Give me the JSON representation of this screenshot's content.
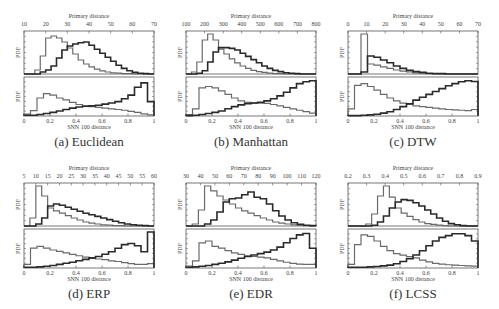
{
  "figure": {
    "panels": [
      {
        "id": "a",
        "caption": "(a) Euclidean",
        "top_axis_label": "Primary distance",
        "bottom_axis_label": "SNN 100 distance",
        "ylabel": "PDF",
        "top_ticks": [
          "10",
          "20",
          "30",
          "40",
          "50",
          "60",
          "70"
        ],
        "bottom_ticks": [
          "0",
          "0.2",
          "0.4",
          "0.6",
          "0.8",
          "1"
        ]
      },
      {
        "id": "b",
        "caption": "(b) Manhattan",
        "top_axis_label": "Primary distance",
        "bottom_axis_label": "SNN 100 distance",
        "ylabel": "PDF",
        "top_ticks": [
          "100",
          "200",
          "300",
          "400",
          "500",
          "600",
          "700",
          "800"
        ],
        "bottom_ticks": [
          "0",
          "0.2",
          "0.4",
          "0.6",
          "0.8",
          "1"
        ]
      },
      {
        "id": "c",
        "caption": "(c) DTW",
        "top_axis_label": "Primary distance",
        "bottom_axis_label": "SNN 100 distance",
        "ylabel": "PDF",
        "top_ticks": [
          "0",
          "10",
          "20",
          "30",
          "40",
          "50",
          "60",
          "70"
        ],
        "bottom_ticks": [
          "0",
          "0.2",
          "0.4",
          "0.6",
          "0.8",
          "1"
        ]
      },
      {
        "id": "d",
        "caption": "(d) ERP",
        "top_axis_label": "Primary distance",
        "bottom_axis_label": "SNN 100 distance",
        "ylabel": "PDF",
        "top_ticks": [
          "5",
          "10",
          "15",
          "20",
          "25",
          "30",
          "35",
          "40",
          "45",
          "50",
          "55",
          "60"
        ],
        "bottom_ticks": [
          "0",
          "0.2",
          "0.4",
          "0.6",
          "0.8",
          "1"
        ]
      },
      {
        "id": "e",
        "caption": "(e) EDR",
        "top_axis_label": "Primary distance",
        "bottom_axis_label": "SNN 100 distance",
        "ylabel": "PDF",
        "top_ticks": [
          "30",
          "40",
          "50",
          "60",
          "70",
          "80",
          "90",
          "100",
          "110",
          "120"
        ],
        "bottom_ticks": [
          "0",
          "0.2",
          "0.4",
          "0.6",
          "0.8",
          "1"
        ]
      },
      {
        "id": "f",
        "caption": "(f) LCSS",
        "top_axis_label": "Primary distance",
        "bottom_axis_label": "SNN 100 distance",
        "ylabel": "PDF",
        "top_ticks": [
          "0.2",
          "0.3",
          "0.4",
          "0.5",
          "0.6",
          "0.7",
          "0.8",
          "0.9"
        ],
        "bottom_ticks": [
          "0",
          "0.2",
          "0.4",
          "0.6",
          "0.8",
          "1"
        ]
      }
    ],
    "colors": {
      "dark_series": "#2a2a2a",
      "light_series": "#6a6a6a",
      "frame": "#555555"
    }
  },
  "chart_data": [
    {
      "type": "bar",
      "title": "(a) Euclidean",
      "xlabel_top": "Primary distance",
      "xlabel_bottom": "SNN 100 distance",
      "ylabel": "PDF",
      "top": {
        "xlim": [
          10,
          70
        ],
        "series": [
          {
            "name": "light",
            "values": [
              0,
              0,
              0.1,
              0.45,
              0.9,
              0.95,
              0.9,
              0.8,
              0.65,
              0.5,
              0.35,
              0.25,
              0.18,
              0.12,
              0.08,
              0.05,
              0.03,
              0.02,
              0.01,
              0.01,
              0,
              0,
              0,
              0
            ]
          },
          {
            "name": "dark",
            "values": [
              0,
              0,
              0,
              0.05,
              0.1,
              0.2,
              0.4,
              0.6,
              0.7,
              0.75,
              0.78,
              0.8,
              0.72,
              0.62,
              0.52,
              0.42,
              0.32,
              0.22,
              0.14,
              0.08,
              0.04,
              0.02,
              0.01,
              0
            ]
          }
        ]
      },
      "bottom": {
        "xlim": [
          0,
          1
        ],
        "series": [
          {
            "name": "light",
            "values": [
              0.05,
              0.15,
              0.5,
              0.62,
              0.58,
              0.5,
              0.45,
              0.38,
              0.32,
              0.28,
              0.26,
              0.24,
              0.22,
              0.2,
              0.18,
              0.16,
              0.13,
              0.1,
              0.06,
              0.03
            ]
          },
          {
            "name": "dark",
            "values": [
              0.02,
              0.02,
              0.04,
              0.07,
              0.1,
              0.14,
              0.18,
              0.22,
              0.25,
              0.27,
              0.28,
              0.3,
              0.33,
              0.36,
              0.4,
              0.48,
              0.58,
              0.8,
              0.92,
              0.4
            ]
          }
        ]
      }
    },
    {
      "type": "bar",
      "title": "(b) Manhattan",
      "xlabel_top": "Primary distance",
      "xlabel_bottom": "SNN 100 distance",
      "ylabel": "PDF",
      "top": {
        "xlim": [
          100,
          800
        ],
        "series": [
          {
            "name": "light",
            "values": [
              0,
              0.05,
              0.3,
              0.85,
              1.0,
              0.85,
              0.62,
              0.5,
              0.38,
              0.28,
              0.2,
              0.14,
              0.09,
              0.06,
              0.04,
              0.02,
              0.01,
              0.01,
              0,
              0,
              0,
              0,
              0,
              0
            ]
          },
          {
            "name": "dark",
            "values": [
              0,
              0,
              0.02,
              0.08,
              0.3,
              0.55,
              0.66,
              0.66,
              0.64,
              0.6,
              0.52,
              0.44,
              0.36,
              0.28,
              0.2,
              0.14,
              0.09,
              0.06,
              0.03,
              0.02,
              0.01,
              0,
              0,
              0
            ]
          }
        ]
      },
      "bottom": {
        "xlim": [
          0,
          1
        ],
        "series": [
          {
            "name": "light",
            "values": [
              0.04,
              0.2,
              0.78,
              0.82,
              0.78,
              0.7,
              0.6,
              0.5,
              0.42,
              0.38,
              0.36,
              0.36,
              0.35,
              0.32,
              0.28,
              0.24,
              0.2,
              0.16,
              0.12,
              0.08
            ]
          },
          {
            "name": "dark",
            "values": [
              0.01,
              0.02,
              0.04,
              0.07,
              0.1,
              0.14,
              0.2,
              0.26,
              0.31,
              0.34,
              0.36,
              0.38,
              0.42,
              0.48,
              0.56,
              0.66,
              0.78,
              0.9,
              0.95,
              0.98
            ]
          }
        ]
      }
    },
    {
      "type": "bar",
      "title": "(c) DTW",
      "xlabel_top": "Primary distance",
      "xlabel_bottom": "SNN 100 distance",
      "ylabel": "PDF",
      "top": {
        "xlim": [
          0,
          70
        ],
        "series": [
          {
            "name": "light",
            "values": [
              0,
              0,
              1.0,
              0.25,
              0.22,
              0.18,
              0.14,
              0.1,
              0.07,
              0.05,
              0.03,
              0.02,
              0.01,
              0.01,
              0,
              0,
              0,
              0,
              0,
              0
            ]
          },
          {
            "name": "dark",
            "values": [
              0,
              0,
              0.05,
              0.45,
              0.42,
              0.35,
              0.28,
              0.2,
              0.14,
              0.09,
              0.06,
              0.04,
              0.02,
              0.01,
              0.01,
              0,
              0,
              0,
              0,
              0
            ]
          }
        ]
      },
      "bottom": {
        "xlim": [
          0,
          1
        ],
        "series": [
          {
            "name": "light",
            "values": [
              0.2,
              0.85,
              0.9,
              0.82,
              0.72,
              0.6,
              0.5,
              0.42,
              0.36,
              0.32,
              0.28,
              0.26,
              0.24,
              0.22,
              0.2,
              0.18,
              0.17,
              0.16,
              0.15,
              0.18
            ]
          },
          {
            "name": "dark",
            "values": [
              0.01,
              0.01,
              0.02,
              0.03,
              0.05,
              0.08,
              0.12,
              0.18,
              0.26,
              0.34,
              0.44,
              0.52,
              0.6,
              0.68,
              0.76,
              0.84,
              0.9,
              0.95,
              0.98,
              0.96
            ]
          }
        ]
      }
    },
    {
      "type": "bar",
      "title": "(d) ERP",
      "xlabel_top": "Primary distance",
      "xlabel_bottom": "SNN 100 distance",
      "ylabel": "PDF",
      "top": {
        "xlim": [
          5,
          60
        ],
        "series": [
          {
            "name": "light",
            "values": [
              0,
              0.2,
              1.0,
              0.75,
              0.45,
              0.38,
              0.32,
              0.26,
              0.2,
              0.15,
              0.1,
              0.07,
              0.05,
              0.03,
              0.02,
              0.01,
              0.01,
              0,
              0,
              0,
              0,
              0
            ]
          },
          {
            "name": "dark",
            "values": [
              0,
              0,
              0.05,
              0.2,
              0.5,
              0.55,
              0.52,
              0.47,
              0.42,
              0.37,
              0.32,
              0.28,
              0.24,
              0.2,
              0.16,
              0.12,
              0.08,
              0.05,
              0.03,
              0.02,
              0.01,
              0
            ]
          }
        ]
      },
      "bottom": {
        "xlim": [
          0,
          1
        ],
        "series": [
          {
            "name": "light",
            "values": [
              0.1,
              0.55,
              0.6,
              0.55,
              0.5,
              0.46,
              0.42,
              0.38,
              0.34,
              0.3,
              0.27,
              0.25,
              0.23,
              0.2,
              0.18,
              0.15,
              0.12,
              0.1,
              0.1,
              0.12
            ]
          },
          {
            "name": "dark",
            "values": [
              0.02,
              0.02,
              0.03,
              0.05,
              0.07,
              0.1,
              0.13,
              0.16,
              0.2,
              0.24,
              0.28,
              0.32,
              0.38,
              0.45,
              0.55,
              0.65,
              0.68,
              0.62,
              0.45,
              1.0
            ]
          }
        ]
      }
    },
    {
      "type": "bar",
      "title": "(e) EDR",
      "xlabel_top": "Primary distance",
      "xlabel_bottom": "SNN 100 distance",
      "ylabel": "PDF",
      "top": {
        "xlim": [
          30,
          120
        ],
        "series": [
          {
            "name": "light",
            "values": [
              0,
              0.05,
              0.4,
              1.0,
              0.88,
              0.75,
              0.65,
              0.55,
              0.45,
              0.38,
              0.32,
              0.26,
              0.2,
              0.15,
              0.1,
              0.07,
              0.05,
              0.03,
              0.02,
              0.01,
              0
            ]
          },
          {
            "name": "dark",
            "values": [
              0,
              0,
              0,
              0.05,
              0.15,
              0.35,
              0.6,
              0.68,
              0.7,
              0.78,
              0.85,
              0.72,
              0.68,
              0.55,
              0.38,
              0.25,
              0.15,
              0.08,
              0.04,
              0.02,
              0.01
            ]
          }
        ]
      },
      "bottom": {
        "xlim": [
          0,
          1
        ],
        "series": [
          {
            "name": "light",
            "values": [
              0.05,
              0.2,
              0.7,
              0.75,
              0.6,
              0.55,
              0.48,
              0.42,
              0.38,
              0.34,
              0.32,
              0.3,
              0.28,
              0.24,
              0.2,
              0.16,
              0.13,
              0.11,
              0.1,
              0.1
            ]
          },
          {
            "name": "dark",
            "values": [
              0.02,
              0.03,
              0.05,
              0.07,
              0.1,
              0.13,
              0.17,
              0.22,
              0.27,
              0.32,
              0.36,
              0.4,
              0.44,
              0.5,
              0.58,
              0.7,
              0.82,
              0.92,
              0.96,
              0.55
            ]
          }
        ]
      }
    },
    {
      "type": "bar",
      "title": "(f) LCSS",
      "xlabel_top": "Primary distance",
      "xlabel_bottom": "SNN 100 distance",
      "ylabel": "PDF",
      "top": {
        "xlim": [
          0.2,
          0.9
        ],
        "series": [
          {
            "name": "light",
            "values": [
              0,
              0,
              0,
              0.05,
              0.3,
              0.75,
              1.0,
              0.72,
              0.45,
              0.32,
              0.24,
              0.16,
              0.1,
              0.06,
              0.04,
              0.02,
              0.01,
              0,
              0,
              0,
              0,
              0
            ]
          },
          {
            "name": "dark",
            "values": [
              0,
              0,
              0,
              0,
              0.02,
              0.1,
              0.25,
              0.45,
              0.6,
              0.66,
              0.64,
              0.58,
              0.5,
              0.4,
              0.3,
              0.2,
              0.12,
              0.06,
              0.03,
              0.01,
              0,
              0
            ]
          }
        ]
      },
      "bottom": {
        "xlim": [
          0,
          1
        ],
        "series": [
          {
            "name": "light",
            "values": [
              0.1,
              0.65,
              0.92,
              0.88,
              0.75,
              0.6,
              0.48,
              0.4,
              0.36,
              0.32,
              0.28,
              0.22,
              0.17,
              0.13,
              0.11,
              0.09,
              0.08,
              0.07,
              0.06,
              0.05
            ]
          },
          {
            "name": "dark",
            "values": [
              0.02,
              0.02,
              0.02,
              0.03,
              0.04,
              0.06,
              0.08,
              0.12,
              0.18,
              0.26,
              0.36,
              0.48,
              0.62,
              0.75,
              0.85,
              0.9,
              0.95,
              0.95,
              0.9,
              0.75
            ]
          }
        ]
      }
    }
  ]
}
